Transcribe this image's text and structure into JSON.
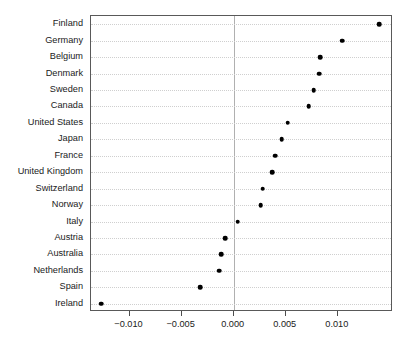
{
  "chart_data": {
    "type": "scatter",
    "subtype": "dot-plot",
    "title": "",
    "subtitle": "",
    "xlabel": "",
    "ylabel": "",
    "orientation": "horizontal",
    "grid": true,
    "grid_style": "dotted-horizontal",
    "legend": "none",
    "reference_line": 0.0,
    "xlim": [
      -0.0137,
      0.0153
    ],
    "xticks": [
      -0.01,
      -0.005,
      0.0,
      0.005,
      0.01
    ],
    "xtick_labels": [
      "−0.010",
      "−0.005",
      "0.000",
      "0.005",
      "0.010"
    ],
    "categories": [
      "Finland",
      "Germany",
      "Belgium",
      "Denmark",
      "Sweden",
      "Canada",
      "United States",
      "Japan",
      "France",
      "United Kingdom",
      "Switzerland",
      "Norway",
      "Italy",
      "Austria",
      "Australia",
      "Netherlands",
      "Spain",
      "Ireland"
    ],
    "values": [
      0.014,
      0.0104,
      0.0083,
      0.0082,
      0.0077,
      0.0072,
      0.0052,
      0.0046,
      0.004,
      0.0037,
      0.0028,
      0.0026,
      0.0004,
      -0.0008,
      -0.0012,
      -0.0014,
      -0.0032,
      -0.0127
    ],
    "point_color": "#000000",
    "grid_color": "#cfcfcf",
    "reference_line_color": "#b0b0b0",
    "frame_color": "#595959"
  }
}
